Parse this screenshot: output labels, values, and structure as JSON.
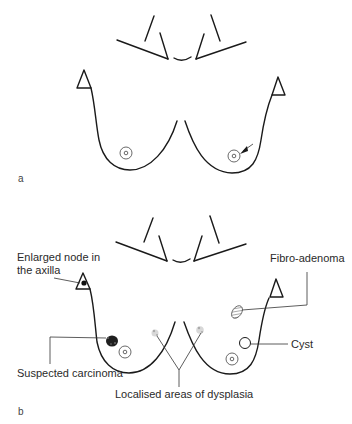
{
  "figure": {
    "panels": [
      {
        "id": "a",
        "label": "a"
      },
      {
        "id": "b",
        "label": "b"
      }
    ]
  },
  "annotations": {
    "enlarged_node_line1": "Enlarged node in",
    "enlarged_node_line2": "the axilla",
    "fibro_adenoma": "Fibro-adenoma",
    "suspected_carcinoma": "Suspected carcinoma",
    "cyst": "Cyst",
    "dysplasia": "Localised areas of dysplasia"
  },
  "colors": {
    "line": "#1a1a1a",
    "background": "#ffffff"
  }
}
